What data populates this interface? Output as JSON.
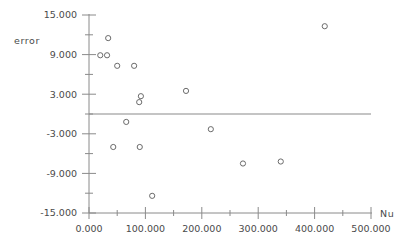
{
  "chart_data": {
    "type": "scatter",
    "title": "",
    "xlabel": "Nu",
    "ylabel": "error",
    "xlim": [
      0.0,
      500.0
    ],
    "ylim": [
      -15.0,
      15.0
    ],
    "grid": false,
    "legend": null,
    "xticks": [
      {
        "value": 0.0,
        "label": "0.000",
        "major": true
      },
      {
        "value": 50.0,
        "label": "",
        "major": false
      },
      {
        "value": 100.0,
        "label": "100.000",
        "major": true
      },
      {
        "value": 150.0,
        "label": "",
        "major": false
      },
      {
        "value": 200.0,
        "label": "200.000",
        "major": true
      },
      {
        "value": 250.0,
        "label": "",
        "major": false
      },
      {
        "value": 300.0,
        "label": "300.000",
        "major": true
      },
      {
        "value": 350.0,
        "label": "",
        "major": false
      },
      {
        "value": 400.0,
        "label": "400.000",
        "major": true
      },
      {
        "value": 450.0,
        "label": "",
        "major": false
      },
      {
        "value": 500.0,
        "label": "500.000",
        "major": true
      }
    ],
    "yticks": [
      {
        "value": 15.0,
        "label": "15.000",
        "major": true
      },
      {
        "value": 12.0,
        "label": "",
        "major": false
      },
      {
        "value": 9.0,
        "label": "9.000",
        "major": true
      },
      {
        "value": 6.0,
        "label": "",
        "major": false
      },
      {
        "value": 3.0,
        "label": "3.000",
        "major": true
      },
      {
        "value": 0.0,
        "label": "",
        "major": false
      },
      {
        "value": -3.0,
        "label": "-3.000",
        "major": true
      },
      {
        "value": -6.0,
        "label": "",
        "major": false
      },
      {
        "value": -9.0,
        "label": "-9.000",
        "major": true
      },
      {
        "value": -12.0,
        "label": "",
        "major": false
      },
      {
        "value": -15.0,
        "label": "-15.000",
        "major": true
      }
    ],
    "reference_line": {
      "y": 0.0,
      "x_from": 0.0,
      "x_to": 500.0,
      "color": "#8a8a8a"
    },
    "marker": {
      "shape": "open-circle",
      "size": 4,
      "color": "#6b6b6b"
    },
    "points": [
      {
        "x": 34.0,
        "y": 11.5
      },
      {
        "x": 20.0,
        "y": 8.9
      },
      {
        "x": 32.0,
        "y": 8.9
      },
      {
        "x": 50.0,
        "y": 7.3
      },
      {
        "x": 80.0,
        "y": 7.3
      },
      {
        "x": 92.0,
        "y": 2.7
      },
      {
        "x": 89.0,
        "y": 1.8
      },
      {
        "x": 172.0,
        "y": 3.5
      },
      {
        "x": 66.0,
        "y": -1.2
      },
      {
        "x": 216.0,
        "y": -2.3
      },
      {
        "x": 43.0,
        "y": -5.0
      },
      {
        "x": 90.0,
        "y": -5.0
      },
      {
        "x": 273.0,
        "y": -7.5
      },
      {
        "x": 340.0,
        "y": -7.2
      },
      {
        "x": 112.0,
        "y": -12.4
      },
      {
        "x": 418.0,
        "y": 13.3
      }
    ]
  },
  "colors": {
    "axis": "#8a8a8a",
    "text": "#4a4a4a",
    "marker": "#6b6b6b",
    "background": "#ffffff"
  }
}
